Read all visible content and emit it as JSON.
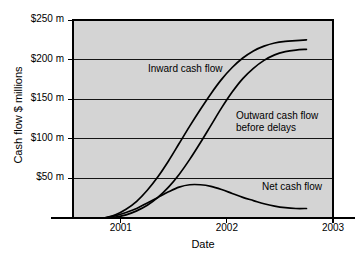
{
  "chart_data": {
    "type": "line",
    "title": "",
    "xlabel": "Date",
    "ylabel": "Cash flow $ millions",
    "grid": true,
    "legend_position": "inline-annotations",
    "plot_background": "#d4d4d4",
    "line_color": "#000000",
    "xlim": [
      2000.55,
      2003.0
    ],
    "ylim": [
      0,
      250
    ],
    "x_tick_labels": [
      "2001",
      "2002",
      "2003"
    ],
    "x_tick_values": [
      2001,
      2002,
      2003
    ],
    "y_tick_labels": [
      "$50 m",
      "$100 m",
      "$150 m",
      "$200 m",
      "$250 m"
    ],
    "y_tick_values": [
      50,
      100,
      150,
      200,
      250
    ],
    "series": [
      {
        "name": "Inward cash flow",
        "label": "Inward cash flow",
        "x": [
          2000.85,
          2000.95,
          2001.05,
          2001.15,
          2001.25,
          2001.35,
          2001.45,
          2001.55,
          2001.65,
          2001.75,
          2001.85,
          2001.95,
          2002.05,
          2002.15,
          2002.25,
          2002.35,
          2002.45,
          2002.55,
          2002.65,
          2002.75
        ],
        "y": [
          0,
          4,
          11,
          21,
          35,
          52,
          72,
          94,
          116,
          137,
          157,
          175,
          190,
          202,
          211,
          217,
          221,
          223,
          224,
          225
        ]
      },
      {
        "name": "Outward cash flow before delays",
        "label": "Outward cash flow\nbefore delays",
        "x": [
          2000.85,
          2000.95,
          2001.05,
          2001.15,
          2001.25,
          2001.35,
          2001.45,
          2001.55,
          2001.65,
          2001.75,
          2001.85,
          2001.95,
          2002.05,
          2002.15,
          2002.25,
          2002.35,
          2002.45,
          2002.55,
          2002.65,
          2002.75
        ],
        "y": [
          0,
          1,
          4,
          9,
          16,
          26,
          39,
          55,
          74,
          95,
          117,
          139,
          159,
          176,
          189,
          199,
          206,
          210,
          212,
          213
        ]
      },
      {
        "name": "Net cash flow",
        "label": "Net cash flow",
        "x": [
          2000.85,
          2000.95,
          2001.05,
          2001.15,
          2001.25,
          2001.35,
          2001.45,
          2001.55,
          2001.65,
          2001.75,
          2001.85,
          2001.95,
          2002.05,
          2002.15,
          2002.25,
          2002.35,
          2002.45,
          2002.55,
          2002.65,
          2002.75
        ],
        "y": [
          0,
          3,
          7,
          12,
          19,
          26,
          33,
          39,
          42,
          42,
          40,
          36,
          31,
          26,
          22,
          18,
          15,
          13,
          12,
          12
        ]
      }
    ],
    "annotations": [
      {
        "text": "Inward cash flow",
        "x_px": 148,
        "y_px": 63
      },
      {
        "text": "Outward cash flow",
        "x_px": 236,
        "y_px": 110
      },
      {
        "text": "before delays",
        "x_px": 236,
        "y_px": 122
      },
      {
        "text": "Net cash flow",
        "x_px": 262,
        "y_px": 181
      }
    ]
  }
}
